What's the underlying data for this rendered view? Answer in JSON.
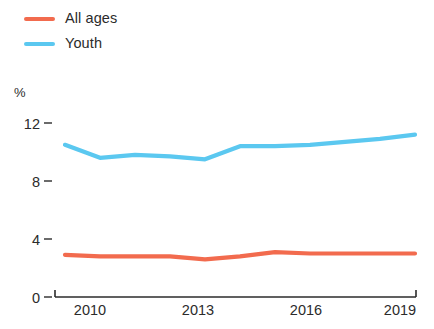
{
  "legend": {
    "items": [
      {
        "label": "All ages",
        "color": "#F26B4E",
        "key": "all_ages"
      },
      {
        "label": "Youth",
        "color": "#5BC8F0",
        "key": "youth"
      }
    ]
  },
  "axes": {
    "y_unit": "%",
    "y_ticks": [
      "12",
      "8",
      "4",
      "0"
    ],
    "x_ticks": [
      "2010",
      "2013",
      "2016",
      "2019"
    ]
  },
  "chart_data": {
    "type": "line",
    "title": "",
    "subtitle": "",
    "xlabel": "",
    "ylabel": "%",
    "ylim": [
      0,
      13
    ],
    "xlim": [
      2010,
      2020
    ],
    "grid": false,
    "legend_position": "top-left",
    "x": [
      2010,
      2011,
      2012,
      2013,
      2014,
      2015,
      2016,
      2017,
      2018,
      2019,
      2020
    ],
    "categories": [
      "2010",
      "2011",
      "2012",
      "2013",
      "2014",
      "2015",
      "2016",
      "2017",
      "2018",
      "2019",
      "2020"
    ],
    "series": [
      {
        "name": "All ages",
        "color": "#F26B4E",
        "values": [
          2.9,
          2.8,
          2.8,
          2.8,
          2.6,
          2.8,
          3.1,
          3.0,
          3.0,
          3.0,
          3.0
        ]
      },
      {
        "name": "Youth",
        "color": "#5BC8F0",
        "values": [
          10.5,
          9.6,
          9.8,
          9.7,
          9.5,
          10.4,
          10.4,
          10.5,
          10.7,
          10.9,
          11.2
        ]
      }
    ]
  }
}
